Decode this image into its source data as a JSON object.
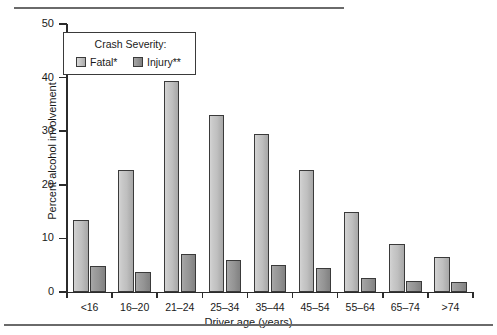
{
  "chart_data": {
    "type": "bar",
    "title": "",
    "xlabel": "Driver age (years)",
    "ylabel": "Percent alcohol involvement",
    "ylim": [
      0,
      50
    ],
    "yticks": [
      0,
      10,
      20,
      30,
      40,
      50
    ],
    "grid": false,
    "legend_position": "upper-left-inside",
    "legend_title": "Crash Severity:",
    "categories": [
      "<16",
      "16–20",
      "21–24",
      "25–34",
      "35–44",
      "45–54",
      "55–64",
      "65–74",
      ">74"
    ],
    "series": [
      {
        "name": "Fatal*",
        "color": "#c3c3c3",
        "values": [
          13.4,
          22.7,
          39.4,
          33.0,
          29.4,
          22.8,
          14.9,
          9.0,
          6.6
        ]
      },
      {
        "name": "Injury**",
        "color": "#939393",
        "values": [
          4.8,
          3.7,
          7.0,
          6.0,
          5.0,
          4.4,
          2.6,
          2.0,
          1.8
        ]
      }
    ]
  },
  "figure": {
    "legend": {
      "title": "Crash Severity:",
      "entries": [
        {
          "label": "Fatal*",
          "swatch": "legend-swatch-fatal"
        },
        {
          "label": "Injury**",
          "swatch": "legend-swatch-injury"
        }
      ]
    },
    "axes": {
      "y_title": "Percent alcohol involvement",
      "x_title": "Driver age (years)",
      "y_tick_labels": [
        "0",
        "10",
        "20",
        "30",
        "40",
        "50"
      ],
      "x_tick_labels": [
        "<16",
        "16–20",
        "21–24",
        "25–34",
        "35–44",
        "45–54",
        "55–64",
        "65–74",
        ">74"
      ]
    }
  },
  "rules": {
    "top": "horizontal-rule",
    "bottom": "horizontal-rule"
  }
}
